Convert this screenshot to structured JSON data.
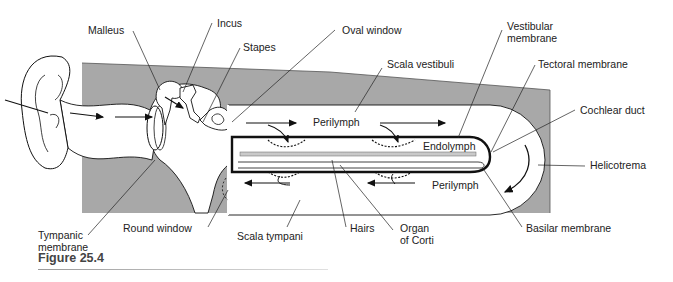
{
  "figure": {
    "caption": "Figure 25.4",
    "colors": {
      "bone": "#a8a8a8",
      "outline": "#111111",
      "fluid": "#ffffff",
      "text": "#222222"
    }
  },
  "labels": {
    "malleus": "Malleus",
    "incus": "Incus",
    "stapes": "Stapes",
    "oval_window": "Oval window",
    "scala_vestibuli": "Scala vestibuli",
    "vestibular_membrane": "Vestibular\nmembrane",
    "tectoral_membrane": "Tectoral membrane",
    "cochlear_duct": "Cochlear duct",
    "helicotrema": "Helicotrema",
    "basilar_membrane": "Basilar membrane",
    "organ_of_corti": "Organ\nof Corti",
    "hairs": "Hairs",
    "scala_tympani": "Scala tympani",
    "round_window": "Round window",
    "tympanic_membrane": "Tympanic\nmembrane"
  },
  "inner_labels": {
    "perilymph_top": "Perilymph",
    "endolymph": "Endolymph",
    "perilymph_bottom": "Perilymph"
  }
}
